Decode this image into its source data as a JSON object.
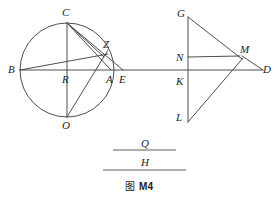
{
  "figure": {
    "caption_cjk": "图",
    "caption_id": "M4",
    "stroke_color": "#3a3a3a",
    "background_color": "#ffffff",
    "label_color": "#1c1c1c"
  },
  "left_figure": {
    "name": "circle-construction",
    "circle": {
      "cx": 67,
      "cy": 70,
      "r": 47
    },
    "points": [
      {
        "id": "B",
        "label": "B",
        "x": 20,
        "y": 70,
        "lx": 8,
        "ly": 64
      },
      {
        "id": "C",
        "label": "C",
        "x": 67,
        "y": 23,
        "lx": 62,
        "ly": 7
      },
      {
        "id": "Z",
        "label": "Z",
        "x": 104,
        "y": 56,
        "lx": 103,
        "ly": 39
      },
      {
        "id": "R",
        "label": "R",
        "x": 67,
        "y": 70,
        "lx": 62,
        "ly": 74
      },
      {
        "id": "A",
        "label": "A",
        "x": 111,
        "y": 70,
        "lx": 106,
        "ly": 74
      },
      {
        "id": "E",
        "label": "E",
        "x": 122,
        "y": 70,
        "lx": 119,
        "ly": 74
      },
      {
        "id": "O",
        "label": "O",
        "x": 67,
        "y": 117,
        "lx": 62,
        "ly": 120
      }
    ],
    "segments": [
      {
        "name": "chord-B-D-horizontal",
        "x1": 20,
        "y1": 70,
        "x2": 263,
        "y2": 70
      },
      {
        "name": "chord-C-O-vertical",
        "x1": 67,
        "y1": 23,
        "x2": 67,
        "y2": 117
      },
      {
        "name": "chord-B-Z",
        "x1": 20,
        "y1": 70,
        "x2": 108,
        "y2": 54
      },
      {
        "name": "chord-C-Z",
        "x1": 67,
        "y1": 23,
        "x2": 104,
        "y2": 57
      },
      {
        "name": "chord-C-A",
        "x1": 67,
        "y1": 23,
        "x2": 111,
        "y2": 70
      },
      {
        "name": "line-C-E",
        "x1": 67,
        "y1": 23,
        "x2": 123,
        "y2": 70
      },
      {
        "name": "line-O-Z",
        "x1": 67,
        "y1": 117,
        "x2": 108,
        "y2": 50
      }
    ]
  },
  "right_figure": {
    "name": "kite-construction",
    "points": [
      {
        "id": "G",
        "label": "G",
        "x": 188,
        "y": 17,
        "lx": 177,
        "ly": 8
      },
      {
        "id": "M",
        "label": "M",
        "x": 240,
        "y": 57,
        "lx": 240,
        "ly": 44
      },
      {
        "id": "N",
        "label": "N",
        "x": 188,
        "y": 57,
        "lx": 176,
        "ly": 52
      },
      {
        "id": "K",
        "label": "K",
        "x": 188,
        "y": 76,
        "lx": 176,
        "ly": 76
      },
      {
        "id": "D",
        "label": "D",
        "x": 263,
        "y": 70,
        "lx": 263,
        "ly": 64
      },
      {
        "id": "L",
        "label": "L",
        "x": 188,
        "y": 122,
        "lx": 176,
        "ly": 112
      }
    ],
    "segments": [
      {
        "name": "line-G-L-vertical",
        "x1": 188,
        "y1": 17,
        "x2": 188,
        "y2": 122
      },
      {
        "name": "line-G-M",
        "x1": 188,
        "y1": 17,
        "x2": 242,
        "y2": 59
      },
      {
        "name": "line-N-M",
        "x1": 188,
        "y1": 57,
        "x2": 240,
        "y2": 56
      },
      {
        "name": "line-M-D",
        "x1": 242,
        "y1": 56,
        "x2": 263,
        "y2": 70
      },
      {
        "name": "line-M-L",
        "x1": 243,
        "y1": 58,
        "x2": 188,
        "y2": 122
      }
    ]
  },
  "fraction_block": {
    "numerator": "Q",
    "denominator": "H",
    "numerator_rule": {
      "x1": 113,
      "y1": 150,
      "x2": 176,
      "y2": 150
    },
    "denominator_rule": {
      "x1": 103,
      "y1": 170,
      "x2": 186,
      "y2": 170
    },
    "numerator_pos": {
      "x": 141,
      "y": 138
    },
    "denominator_pos": {
      "x": 141,
      "y": 157
    }
  }
}
